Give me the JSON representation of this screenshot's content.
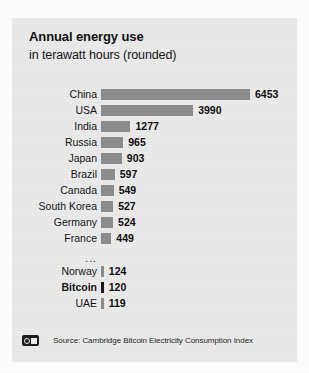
{
  "card": {
    "title": "Annual energy use",
    "subtitle": "in terawatt hours (rounded)",
    "ellipsis": "...",
    "source": "Source: Cambridge Bitcoin Electricity Consumption Index",
    "brand_icon": "dw-logo-icon",
    "bar_color": "#8c8c8c",
    "highlight_bar_color": "#1a1a1a",
    "card_background": "#e9e9e9"
  },
  "chart_data": {
    "type": "bar",
    "orientation": "horizontal",
    "title": "Annual energy use",
    "subtitle": "in terawatt hours (rounded)",
    "xlabel": "",
    "ylabel": "",
    "unit": "TWh",
    "grid": false,
    "legend": null,
    "axis_visible": false,
    "value_labels": true,
    "xlim": [
      0,
      6453
    ],
    "categories": [
      "China",
      "USA",
      "India",
      "Russia",
      "Japan",
      "Brazil",
      "Canada",
      "South Korea",
      "Germany",
      "France",
      "Norway",
      "Bitcoin",
      "UAE"
    ],
    "values": [
      6453,
      3990,
      1277,
      965,
      903,
      597,
      549,
      527,
      524,
      449,
      124,
      120,
      119
    ],
    "highlight_category": "Bitcoin",
    "break_after_index": 9,
    "break_marker": "...",
    "rows": [
      {
        "label": "China",
        "value": 6453,
        "highlight": false
      },
      {
        "label": "USA",
        "value": 3990,
        "highlight": false
      },
      {
        "label": "India",
        "value": 1277,
        "highlight": false
      },
      {
        "label": "Russia",
        "value": 965,
        "highlight": false
      },
      {
        "label": "Japan",
        "value": 903,
        "highlight": false
      },
      {
        "label": "Brazil",
        "value": 597,
        "highlight": false
      },
      {
        "label": "Canada",
        "value": 549,
        "highlight": false
      },
      {
        "label": "South Korea",
        "value": 527,
        "highlight": false
      },
      {
        "label": "Germany",
        "value": 524,
        "highlight": false
      },
      {
        "label": "France",
        "value": 449,
        "highlight": false
      },
      {
        "label": "Norway",
        "value": 124,
        "highlight": false
      },
      {
        "label": "Bitcoin",
        "value": 120,
        "highlight": true
      },
      {
        "label": "UAE",
        "value": 119,
        "highlight": false
      }
    ]
  }
}
